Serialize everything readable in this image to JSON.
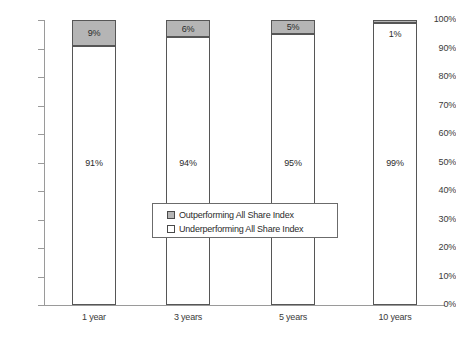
{
  "chart_data": {
    "type": "bar",
    "title": "",
    "subtitle": "",
    "xlabel": "",
    "ylabel": "",
    "stacked": true,
    "stack_total": 100,
    "grid": false,
    "legend_position": "center",
    "ylim": [
      0,
      100
    ],
    "categories": [
      "1 year",
      "3 years",
      "5 years",
      "10 years"
    ],
    "ytick_labels": [
      "0%",
      "10%",
      "20%",
      "30%",
      "40%",
      "50%",
      "60%",
      "70%",
      "80%",
      "90%",
      "100%"
    ],
    "ytick_values": [
      0,
      10,
      20,
      30,
      40,
      50,
      60,
      70,
      80,
      90,
      100
    ],
    "series": [
      {
        "name": "Underperforming All Share Index",
        "values": [
          91,
          94,
          95,
          99
        ],
        "labels": [
          "91%",
          "94%",
          "95%",
          "99%"
        ],
        "color": "#ffffff"
      },
      {
        "name": "Outperforming All Share Index",
        "values": [
          9,
          6,
          5,
          1
        ],
        "labels": [
          "9%",
          "6%",
          "5%",
          "1%"
        ],
        "color": "#b5b5b5"
      }
    ]
  },
  "legend": {
    "items": [
      {
        "label": "Outperforming All Share Index",
        "swatch": "gray"
      },
      {
        "label": "Underperforming All Share Index",
        "swatch": "white"
      }
    ]
  },
  "colors": {
    "outperforming": "#b5b5b5",
    "underperforming": "#ffffff",
    "axis": "#9a9a9a",
    "bar_border": "#565656",
    "text": "#2b2b2b"
  }
}
